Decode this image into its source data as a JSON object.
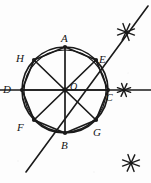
{
  "caption": {
    "text": "In ⊙O, draw diameter AB."
  },
  "figure": {
    "stroke_color": "#1a1a1a",
    "background_color": "#fdfdfd",
    "circle": {
      "center_label": "O",
      "cx": 65,
      "cy": 90,
      "r": 43,
      "double_outline": true,
      "inner_r": 41
    },
    "points": [
      {
        "id": "A",
        "label": "A",
        "x": 65,
        "y": 47,
        "label_x": 61,
        "label_y": 33
      },
      {
        "id": "B",
        "label": "B",
        "x": 65,
        "y": 133,
        "label_x": 61,
        "label_y": 140
      },
      {
        "id": "C",
        "label": "C",
        "x": 108,
        "y": 90,
        "label_x": 106,
        "label_y": 93
      },
      {
        "id": "D",
        "label": "D",
        "x": 22,
        "y": 90,
        "label_x": 3,
        "label_y": 84
      },
      {
        "id": "E",
        "label": "E",
        "x": 96,
        "y": 60,
        "label_x": 99,
        "label_y": 54
      },
      {
        "id": "F",
        "label": "F",
        "x": 34,
        "y": 120,
        "label_x": 17,
        "label_y": 122
      },
      {
        "id": "G",
        "label": "G",
        "x": 96,
        "y": 120,
        "label_x": 93,
        "label_y": 127
      },
      {
        "id": "H",
        "label": "H",
        "x": 34,
        "y": 60,
        "label_x": 16,
        "label_y": 53
      },
      {
        "id": "O",
        "label": "O",
        "x": 65,
        "y": 90,
        "label_x": 70,
        "label_y": 82
      }
    ],
    "diameters": [
      {
        "name": "AB",
        "from": "A",
        "to": "B"
      },
      {
        "name": "DC",
        "from": "D",
        "to": "C"
      },
      {
        "name": "HG",
        "from": "H",
        "to": "G"
      },
      {
        "name": "EF",
        "from": "E",
        "to": "F"
      }
    ],
    "octagon_order": [
      "A",
      "E",
      "C",
      "G",
      "B",
      "F",
      "D",
      "H"
    ],
    "construction_lines": [
      {
        "name": "horizontal-secant",
        "x1": 0,
        "y1": 90,
        "x2": 151,
        "y2": 90
      },
      {
        "name": "diagonal-secant",
        "x1": 26,
        "y1": 172,
        "x2": 148,
        "y2": 6
      }
    ],
    "arc_marks": [
      {
        "name": "upper-right-arc-intersection",
        "x": 126,
        "y": 32,
        "size": 9
      },
      {
        "name": "right-arc-intersection",
        "x": 124,
        "y": 90,
        "size": 7
      },
      {
        "name": "lower-right-arc-intersection",
        "x": 131,
        "y": 163,
        "size": 9
      }
    ]
  }
}
